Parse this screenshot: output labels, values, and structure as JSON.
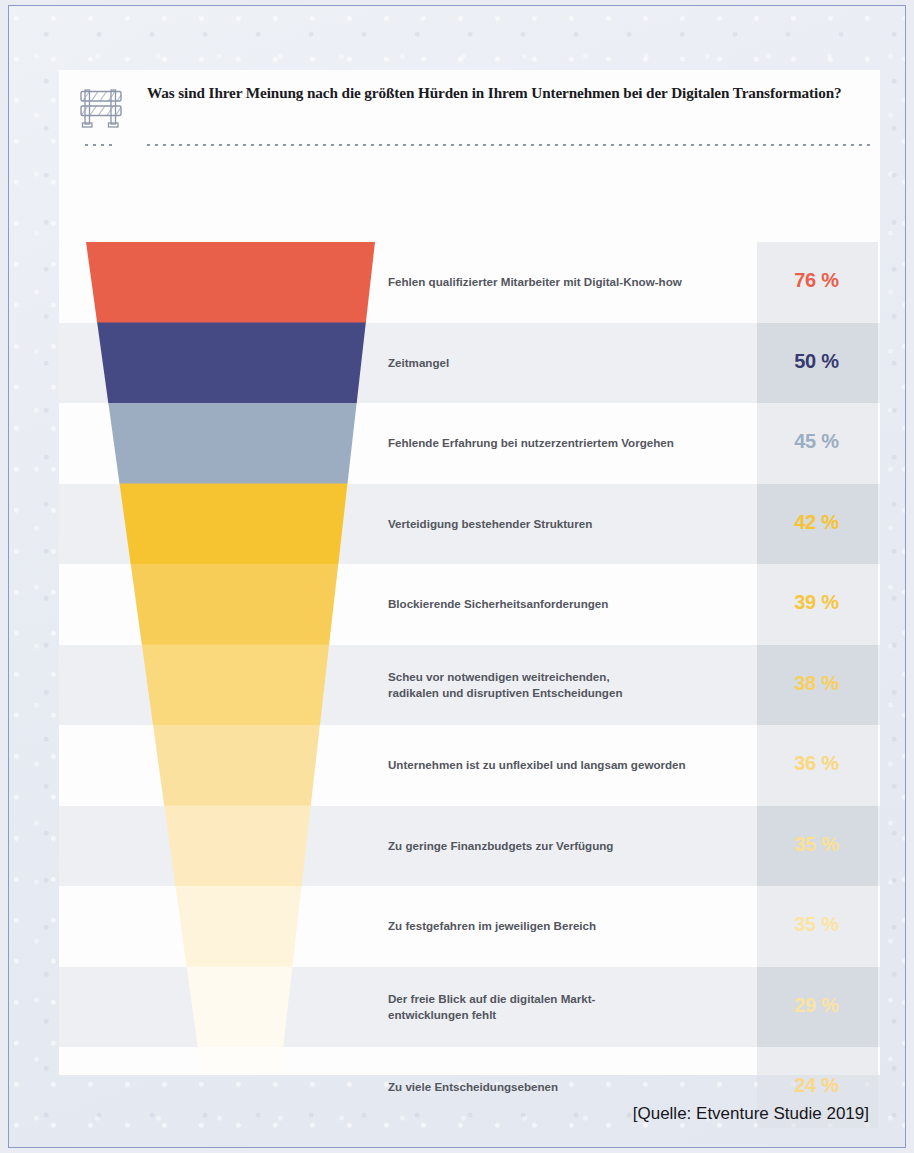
{
  "page": {
    "background_color": "#e9edf3",
    "frame_border_color": "#8b9bc4",
    "card_background": "#fdfdfd"
  },
  "header": {
    "icon": "construction-barricade-icon",
    "title": "Was sind Ihrer Meinung nach die größten Hürden in Ihrem Unternehmen bei der Digitalen Transformation?"
  },
  "source_note": "[Quelle: Etventure Studie 2019]",
  "chart_data": {
    "type": "bar",
    "subtype": "funnel",
    "title": "Was sind Ihrer Meinung nach die größten Hürden in Ihrem Unternehmen bei der Digitalen Transformation?",
    "xlabel": "",
    "ylabel": "",
    "xlim": [
      0,
      100
    ],
    "grid": false,
    "legend": "none",
    "value_suffix": " %",
    "categories": [
      "Fehlen qualifizierter Mitarbeiter mit Digital-Know-how",
      "Zeitmangel",
      "Fehlende Erfahrung bei nutzerzentriertem Vorgehen",
      "Verteidigung bestehender Strukturen",
      "Blockierende Sicherheitsanforderungen",
      "Scheu vor notwendigen weitreichenden, radikalen und disruptiven Entscheidungen",
      "Unternehmen ist zu unflexibel und langsam geworden",
      "Zu geringe Finanzbudgets zur Verfügung",
      "Zu festgefahren im jeweiligen Bereich",
      "Der freie Blick auf die digitalen Markt-entwicklungen fehlt",
      "Zu viele Entscheidungsebenen"
    ],
    "values": [
      76,
      50,
      45,
      42,
      39,
      38,
      36,
      35,
      35,
      29,
      24
    ],
    "rows": [
      {
        "label_lines": [
          "Fehlen qualifizierter Mitarbeiter mit Digital-Know-how"
        ],
        "value": 76,
        "value_text": "76 %",
        "segment_color": "#e8604a",
        "value_color": "#e8604a",
        "band_shaded": false
      },
      {
        "label_lines": [
          "Zeitmangel"
        ],
        "value": 50,
        "value_text": "50 %",
        "segment_color": "#454a85",
        "value_color": "#363a70",
        "band_shaded": true
      },
      {
        "label_lines": [
          "Fehlende Erfahrung bei nutzerzentriertem Vorgehen"
        ],
        "value": 45,
        "value_text": "45 %",
        "segment_color": "#9cadc2",
        "value_color": "#9cadc2",
        "band_shaded": false
      },
      {
        "label_lines": [
          "Verteidigung bestehender Strukturen"
        ],
        "value": 42,
        "value_text": "42 %",
        "segment_color": "#f6c331",
        "value_color": "#f6c331",
        "band_shaded": true
      },
      {
        "label_lines": [
          "Blockierende Sicherheitsanforderungen"
        ],
        "value": 39,
        "value_text": "39 %",
        "segment_color": "#f8cd57",
        "value_color": "#f6c641",
        "band_shaded": false
      },
      {
        "label_lines": [
          "Scheu vor notwendigen weitreichenden,",
          "radikalen und disruptiven Entscheidungen"
        ],
        "value": 38,
        "value_text": "38 %",
        "segment_color": "#fad87c",
        "value_color": "#f7cf5e",
        "band_shaded": true
      },
      {
        "label_lines": [
          "Unternehmen ist zu unflexibel und langsam geworden"
        ],
        "value": 36,
        "value_text": "36 %",
        "segment_color": "#fbe1a0",
        "value_color": "#f9d87e",
        "band_shaded": false
      },
      {
        "label_lines": [
          "Zu geringe Finanzbudgets zur Verfügung"
        ],
        "value": 35,
        "value_text": "35 %",
        "segment_color": "#fdebbf",
        "value_color": "#fae091",
        "band_shaded": true
      },
      {
        "label_lines": [
          "Zu festgefahren im jeweiligen Bereich"
        ],
        "value": 35,
        "value_text": "35 %",
        "segment_color": "#fef4db",
        "value_color": "#fbe4a0",
        "band_shaded": false
      },
      {
        "label_lines": [
          "Der freie Blick auf die digitalen Markt-",
          "entwicklungen fehlt"
        ],
        "value": 29,
        "value_text": "29 %",
        "segment_color": "#fefaf0",
        "value_color": "#fae3a2",
        "band_shaded": true
      },
      {
        "label_lines": [
          "Zu viele Entscheidungsebenen"
        ],
        "value": 24,
        "value_text": "24 %",
        "segment_color": "#fffdfa",
        "value_color": "#f9d887",
        "band_shaded": false
      }
    ]
  }
}
